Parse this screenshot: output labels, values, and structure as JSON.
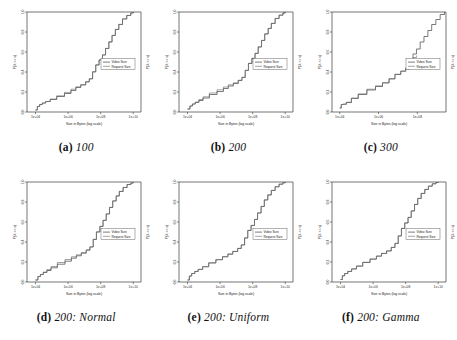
{
  "figure": {
    "title": "",
    "layout": "2x3 grid of empirical CDF plots",
    "panel_count": 6
  },
  "common": {
    "xlabel": "Size in Bytes (log scale)",
    "ylabel": "P(X <= x)",
    "ylabel_right": "P(X <= x)",
    "legend": {
      "entries": [
        "Video Size",
        "Request Size"
      ],
      "position": "center-right"
    },
    "yticks": [
      "0.0",
      "0.2",
      "0.4",
      "0.6",
      "0.8",
      "1.0"
    ],
    "ylim": [
      0.0,
      1.0
    ],
    "colors": {
      "video": "#2b2b2b",
      "request": "#6b6b6b",
      "axis": "#3a3a3a",
      "background": "#ffffff"
    }
  },
  "chart_data": [
    {
      "id": "a",
      "type": "line",
      "title": "100",
      "caption_tag": "(a)",
      "caption_text": "100",
      "xlabel": "Size in Bytes (log scale)",
      "ylabel": "P(X <= x)",
      "xticks": [
        "1e+04",
        "1e+06",
        "1e+08",
        "1e+10"
      ],
      "xtick_values": [
        10000,
        1000000,
        100000000,
        10000000000
      ],
      "xlim": [
        3000,
        30000000000
      ],
      "ylim": [
        0.0,
        1.0
      ],
      "grid": false,
      "legend": [
        "Video Size",
        "Request Size"
      ],
      "series": [
        {
          "name": "Video Size",
          "x": [
            10000,
            13000,
            18000,
            26000,
            42000,
            80000,
            200000,
            600000,
            1500000,
            3000000,
            6000000,
            12000000,
            20000000,
            32000000,
            50000000,
            80000000,
            130000000,
            200000000,
            320000000,
            500000000,
            800000000,
            1300000000,
            2200000000,
            4000000000,
            7000000000,
            10000000000
          ],
          "y": [
            0.02,
            0.055,
            0.075,
            0.09,
            0.105,
            0.125,
            0.155,
            0.185,
            0.215,
            0.245,
            0.27,
            0.3,
            0.33,
            0.4,
            0.47,
            0.52,
            0.57,
            0.635,
            0.7,
            0.765,
            0.825,
            0.875,
            0.93,
            0.965,
            0.99,
            1.0
          ]
        },
        {
          "name": "Request Size",
          "x": [
            10000,
            13000,
            18000,
            26000,
            42000,
            80000,
            200000,
            600000,
            1500000,
            3000000,
            6000000,
            12000000,
            20000000,
            32000000,
            50000000,
            80000000,
            130000000,
            200000000,
            320000000,
            500000000,
            800000000,
            1300000000,
            2200000000,
            4000000000,
            7000000000,
            10000000000
          ],
          "y": [
            0.02,
            0.055,
            0.075,
            0.09,
            0.105,
            0.13,
            0.162,
            0.196,
            0.228,
            0.252,
            0.275,
            0.305,
            0.335,
            0.405,
            0.472,
            0.522,
            0.572,
            0.637,
            0.702,
            0.767,
            0.827,
            0.877,
            0.932,
            0.966,
            0.99,
            1.0
          ]
        }
      ]
    },
    {
      "id": "b",
      "type": "line",
      "title": "200",
      "caption_tag": "(b)",
      "caption_text": "200",
      "xlabel": "Size in Bytes (log scale)",
      "ylabel": "P(X <= x)",
      "xticks": [
        "1e+04",
        "1e+06",
        "1e+08",
        "1e+10"
      ],
      "xtick_values": [
        10000,
        1000000,
        100000000,
        10000000000
      ],
      "xlim": [
        3000,
        30000000000
      ],
      "ylim": [
        0.0,
        1.0
      ],
      "grid": false,
      "legend": [
        "Video Size",
        "Request Size"
      ],
      "series": [
        {
          "name": "Video Size",
          "x": [
            10000,
            14000,
            20000,
            30000,
            50000,
            90000,
            220000,
            650000,
            1600000,
            3200000,
            6500000,
            13000000,
            22000000,
            35000000,
            55000000,
            90000000,
            140000000,
            220000000,
            350000000,
            550000000,
            900000000,
            1400000000,
            2400000000,
            4200000000,
            7200000000,
            10000000000
          ],
          "y": [
            0.03,
            0.06,
            0.08,
            0.095,
            0.115,
            0.14,
            0.175,
            0.205,
            0.235,
            0.26,
            0.285,
            0.315,
            0.345,
            0.415,
            0.485,
            0.535,
            0.585,
            0.65,
            0.715,
            0.78,
            0.835,
            0.885,
            0.935,
            0.968,
            0.99,
            1.0
          ]
        },
        {
          "name": "Request Size",
          "x": [
            10000,
            14000,
            20000,
            30000,
            50000,
            90000,
            220000,
            650000,
            1600000,
            3200000,
            6500000,
            13000000,
            22000000,
            35000000,
            55000000,
            90000000,
            140000000,
            220000000,
            350000000,
            550000000,
            900000000,
            1400000000,
            2400000000,
            4200000000,
            7200000000,
            10000000000
          ],
          "y": [
            0.03,
            0.06,
            0.08,
            0.1,
            0.125,
            0.152,
            0.19,
            0.222,
            0.25,
            0.272,
            0.292,
            0.318,
            0.348,
            0.418,
            0.488,
            0.538,
            0.588,
            0.652,
            0.717,
            0.782,
            0.837,
            0.887,
            0.936,
            0.969,
            0.99,
            1.0
          ]
        }
      ]
    },
    {
      "id": "c",
      "type": "line",
      "title": "300",
      "caption_tag": "(c)",
      "caption_text": "300",
      "xlabel": "Size in Bytes (log scale)",
      "ylabel": "P(X <= x)",
      "xticks": [
        "1e+04",
        "1e+06",
        "1e+08"
      ],
      "xtick_values": [
        10000,
        1000000,
        100000000
      ],
      "xlim": [
        4000,
        3000000000
      ],
      "ylim": [
        0.0,
        1.0
      ],
      "grid": false,
      "legend": [
        "Video Size",
        "Request Size"
      ],
      "series": [
        {
          "name": "Video Size",
          "x": [
            10000,
            12000,
            15000,
            22000,
            40000,
            90000,
            250000,
            700000,
            1600000,
            3500000,
            7000000,
            14000000,
            25000000,
            40000000,
            60000000,
            90000000,
            140000000,
            220000000,
            350000000,
            550000000,
            900000000,
            1500000000,
            2500000000
          ],
          "y": [
            0.04,
            0.075,
            0.078,
            0.095,
            0.135,
            0.175,
            0.22,
            0.255,
            0.29,
            0.33,
            0.375,
            0.41,
            0.44,
            0.52,
            0.58,
            0.63,
            0.7,
            0.755,
            0.815,
            0.875,
            0.925,
            0.975,
            1.0
          ]
        },
        {
          "name": "Request Size",
          "x": [
            10000,
            12000,
            15000,
            22000,
            40000,
            90000,
            250000,
            700000,
            1600000,
            3500000,
            7000000,
            14000000,
            25000000,
            40000000,
            60000000,
            90000000
          ],
          "y": [
            0.04,
            0.075,
            0.078,
            0.098,
            0.14,
            0.182,
            0.228,
            0.262,
            0.295,
            0.335,
            0.378,
            0.405,
            0.425,
            0.5,
            0.545,
            0.565
          ]
        }
      ]
    },
    {
      "id": "d",
      "type": "line",
      "title": "200: Normal",
      "caption_tag": "(d)",
      "caption_text": "200: Normal",
      "xlabel": "Size in Bytes (log scale)",
      "ylabel": "P(X <= x)",
      "xticks": [
        "1e+04",
        "1e+06",
        "1e+08",
        "1e+10"
      ],
      "xtick_values": [
        10000,
        1000000,
        100000000,
        10000000000
      ],
      "xlim": [
        3000,
        30000000000
      ],
      "ylim": [
        0.0,
        1.0
      ],
      "grid": false,
      "legend": [
        "Video Size",
        "Request Size"
      ],
      "series": [
        {
          "name": "Video Size",
          "x": [
            10000,
            14000,
            20000,
            30000,
            50000,
            90000,
            220000,
            650000,
            1600000,
            3200000,
            6500000,
            13000000,
            22000000,
            35000000,
            55000000,
            90000000,
            140000000,
            220000000,
            350000000,
            550000000,
            900000000,
            1400000000,
            2400000000,
            4200000000,
            7200000000,
            10000000000
          ],
          "y": [
            0.02,
            0.055,
            0.075,
            0.095,
            0.115,
            0.142,
            0.178,
            0.208,
            0.238,
            0.262,
            0.288,
            0.318,
            0.35,
            0.425,
            0.5,
            0.555,
            0.615,
            0.68,
            0.745,
            0.81,
            0.86,
            0.905,
            0.945,
            0.975,
            0.99,
            1.0
          ]
        },
        {
          "name": "Request Size",
          "x": [
            10000,
            14000,
            20000,
            30000,
            50000,
            90000,
            220000,
            650000,
            1600000,
            3200000,
            6500000,
            13000000,
            22000000,
            35000000,
            55000000,
            90000000,
            140000000,
            220000000,
            350000000,
            550000000,
            900000000,
            1400000000,
            2400000000,
            4200000000,
            7200000000,
            10000000000
          ],
          "y": [
            0.02,
            0.055,
            0.075,
            0.1,
            0.125,
            0.155,
            0.195,
            0.225,
            0.252,
            0.272,
            0.295,
            0.322,
            0.352,
            0.428,
            0.502,
            0.558,
            0.618,
            0.682,
            0.747,
            0.812,
            0.862,
            0.907,
            0.946,
            0.976,
            0.99,
            1.0
          ]
        }
      ]
    },
    {
      "id": "e",
      "type": "line",
      "title": "200: Uniform",
      "caption_tag": "(e)",
      "caption_text": "200: Uniform",
      "xlabel": "Size in Bytes (log scale)",
      "ylabel": "P(X <= x)",
      "xticks": [
        "1e+04",
        "1e+06",
        "1e+08",
        "1e+10"
      ],
      "xtick_values": [
        10000,
        1000000,
        100000000,
        10000000000
      ],
      "xlim": [
        3000,
        30000000000
      ],
      "ylim": [
        0.0,
        1.0
      ],
      "grid": false,
      "legend": [
        "Video Size",
        "Request Size"
      ],
      "series": [
        {
          "name": "Video Size",
          "x": [
            10000,
            13000,
            18000,
            28000,
            45000,
            85000,
            200000,
            550000,
            1400000,
            3000000,
            6000000,
            12000000,
            20000000,
            32000000,
            50000000,
            80000000,
            130000000,
            200000000,
            330000000,
            520000000,
            850000000,
            1400000000,
            2400000000,
            4200000000,
            7200000000,
            10000000000
          ],
          "y": [
            0.02,
            0.06,
            0.085,
            0.105,
            0.125,
            0.152,
            0.19,
            0.222,
            0.252,
            0.278,
            0.305,
            0.335,
            0.37,
            0.44,
            0.515,
            0.565,
            0.625,
            0.69,
            0.755,
            0.82,
            0.87,
            0.915,
            0.952,
            0.978,
            0.993,
            1.0
          ]
        },
        {
          "name": "Request Size",
          "x": [
            10000,
            13000,
            18000,
            28000,
            45000,
            85000,
            200000,
            550000,
            1400000,
            3000000,
            6000000,
            12000000,
            20000000,
            32000000,
            50000000,
            80000000,
            130000000,
            200000000,
            330000000,
            520000000,
            850000000,
            1400000000,
            2400000000,
            4200000000,
            7200000000,
            10000000000
          ],
          "y": [
            0.02,
            0.06,
            0.085,
            0.107,
            0.127,
            0.155,
            0.193,
            0.225,
            0.254,
            0.28,
            0.307,
            0.337,
            0.372,
            0.442,
            0.517,
            0.567,
            0.627,
            0.692,
            0.757,
            0.822,
            0.872,
            0.917,
            0.953,
            0.979,
            0.993,
            1.0
          ]
        }
      ]
    },
    {
      "id": "f",
      "type": "line",
      "title": "200: Gamma",
      "caption_tag": "(f)",
      "caption_text": "200: Gamma",
      "xlabel": "Size in Bytes (log scale)",
      "ylabel": "P(X <= x)",
      "xticks": [
        "1e+04",
        "1e+06",
        "1e+08",
        "1e+10"
      ],
      "xtick_values": [
        10000,
        1000000,
        100000000,
        10000000000
      ],
      "xlim": [
        3000,
        30000000000
      ],
      "ylim": [
        0.0,
        1.0
      ],
      "grid": false,
      "legend": [
        "Video Size",
        "Request Size"
      ],
      "series": [
        {
          "name": "Video Size",
          "x": [
            10000,
            13000,
            18000,
            28000,
            48000,
            95000,
            230000,
            650000,
            1600000,
            3300000,
            6800000,
            13000000,
            22000000,
            35000000,
            55000000,
            88000000,
            140000000,
            220000000,
            350000000,
            550000000,
            900000000,
            1500000000,
            2500000000,
            4300000000,
            7300000000,
            10000000000
          ],
          "y": [
            0.025,
            0.062,
            0.085,
            0.105,
            0.13,
            0.158,
            0.195,
            0.228,
            0.258,
            0.285,
            0.31,
            0.345,
            0.385,
            0.46,
            0.535,
            0.59,
            0.645,
            0.71,
            0.775,
            0.835,
            0.885,
            0.925,
            0.958,
            0.982,
            0.995,
            1.0
          ]
        },
        {
          "name": "Request Size",
          "x": [
            10000,
            13000,
            18000,
            28000,
            48000,
            95000,
            230000,
            650000,
            1600000,
            3300000,
            6800000,
            13000000,
            22000000,
            35000000,
            55000000,
            88000000,
            140000000,
            220000000,
            350000000,
            550000000,
            900000000,
            1500000000,
            2500000000,
            4300000000,
            7300000000,
            10000000000
          ],
          "y": [
            0.025,
            0.062,
            0.085,
            0.107,
            0.132,
            0.161,
            0.198,
            0.231,
            0.26,
            0.287,
            0.312,
            0.347,
            0.387,
            0.462,
            0.537,
            0.592,
            0.647,
            0.712,
            0.777,
            0.837,
            0.887,
            0.927,
            0.959,
            0.983,
            0.995,
            1.0
          ]
        }
      ]
    }
  ]
}
